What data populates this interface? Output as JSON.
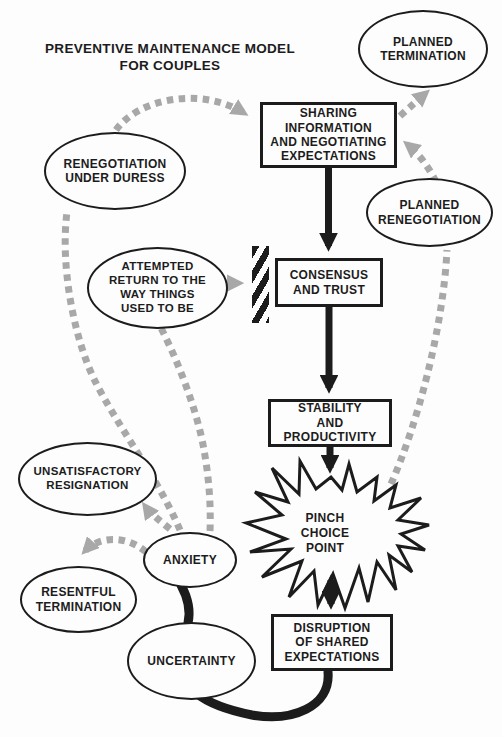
{
  "title": "PREVENTIVE MAINTENANCE MODEL\nFOR COUPLES",
  "colors": {
    "ink": "#1c1c1c",
    "dash": "#a8a8a8",
    "bg": "#fdfdfd"
  },
  "nodes": {
    "planned_termination": {
      "label": "PLANNED\nTERMINATION",
      "shape": "ellipse"
    },
    "sharing": {
      "label": "SHARING\nINFORMATION\nAND NEGOTIATING\nEXPECTATIONS",
      "shape": "rectangle"
    },
    "renegotiation_duress": {
      "label": "RENEGOTIATION\nUNDER DURESS",
      "shape": "ellipse"
    },
    "planned_renegotiation": {
      "label": "PLANNED\nRENEGOTIATION",
      "shape": "ellipse"
    },
    "attempted_return": {
      "label": "ATTEMPTED\nRETURN TO THE\nWAY THINGS\nUSED TO BE",
      "shape": "ellipse"
    },
    "consensus": {
      "label": "CONSENSUS\nAND TRUST",
      "shape": "rectangle"
    },
    "stability": {
      "label": "STABILITY\nAND\nPRODUCTIVITY",
      "shape": "rectangle"
    },
    "pinch": {
      "label": "PINCH\nCHOICE\nPOINT",
      "shape": "starburst"
    },
    "unsatisfactory": {
      "label": "UNSATISFACTORY\nRESIGNATION",
      "shape": "ellipse"
    },
    "anxiety": {
      "label": "ANXIETY",
      "shape": "ellipse"
    },
    "resentful": {
      "label": "RESENTFUL\nTERMINATION",
      "shape": "ellipse"
    },
    "uncertainty": {
      "label": "UNCERTAINTY",
      "shape": "ellipse"
    },
    "disruption": {
      "label": "DISRUPTION\nOF SHARED\nEXPECTATIONS",
      "shape": "rectangle"
    }
  },
  "edges": [
    {
      "from": "sharing",
      "to": "consensus",
      "style": "solid-black-arrow"
    },
    {
      "from": "consensus",
      "to": "stability",
      "style": "solid-black-arrow"
    },
    {
      "from": "stability",
      "to": "pinch",
      "style": "solid-black-arrow"
    },
    {
      "from": "pinch",
      "to": "disruption",
      "style": "solid-black-double-arrow"
    },
    {
      "from": "disruption",
      "to": "uncertainty",
      "style": "solid-black-curve"
    },
    {
      "from": "uncertainty",
      "to": "anxiety",
      "style": "solid-black-line"
    },
    {
      "from": "anxiety",
      "to": "renegotiation_duress",
      "style": "dashed-gray"
    },
    {
      "from": "renegotiation_duress",
      "to": "sharing",
      "style": "dashed-gray-arrow"
    },
    {
      "from": "anxiety",
      "to": "attempted_return",
      "style": "dashed-gray"
    },
    {
      "from": "attempted_return",
      "to": "blocked_barrier",
      "style": "dashed-gray-arrow"
    },
    {
      "from": "anxiety",
      "to": "unsatisfactory",
      "style": "dashed-gray-arrow"
    },
    {
      "from": "anxiety",
      "to": "resentful",
      "style": "dashed-gray-arrow"
    },
    {
      "from": "pinch",
      "to": "planned_renegotiation",
      "style": "dashed-gray"
    },
    {
      "from": "planned_renegotiation",
      "to": "sharing",
      "style": "dashed-gray-arrow"
    },
    {
      "from": "sharing",
      "to": "planned_termination",
      "style": "dashed-gray-arrow"
    }
  ]
}
